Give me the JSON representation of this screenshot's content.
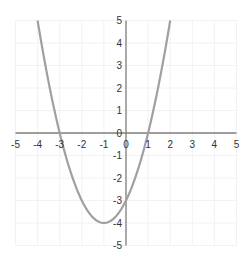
{
  "chart_data": {
    "type": "line",
    "title": "",
    "xlabel": "",
    "ylabel": "",
    "function": "y = x^2 + 2x - 3",
    "xlim": [
      -5,
      5
    ],
    "ylim": [
      -5,
      5
    ],
    "grid": true,
    "legend": null,
    "x_ticks": [
      "-5",
      "-4",
      "-3",
      "-2",
      "-1",
      "0",
      "1",
      "2",
      "3",
      "4",
      "5"
    ],
    "y_ticks": [
      "5",
      "4",
      "3",
      "2",
      "1",
      "0",
      "-1",
      "-2",
      "-3",
      "-4",
      "-5"
    ],
    "series": [
      {
        "name": "parabola",
        "color": "#a0a0a0",
        "x": [
          -4,
          -3.5,
          -3,
          -2.5,
          -2,
          -1.5,
          -1,
          -0.5,
          0,
          0.5,
          1,
          1.5,
          2
        ],
        "y": [
          5,
          2.25,
          0,
          -1.75,
          -3,
          -3.75,
          -4,
          -3.75,
          -3,
          -1.75,
          0,
          2.25,
          5
        ]
      }
    ],
    "annotations": {
      "vertex": [
        -1,
        -4
      ],
      "roots": [
        -3,
        1
      ],
      "y_intercept": -3
    }
  },
  "colors": {
    "axis": "#7f7f7f",
    "grid": "#f2f2f2",
    "curve": "#a0a0a0",
    "text": "#333333"
  }
}
